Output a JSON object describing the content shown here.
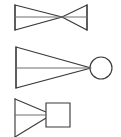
{
  "canvas": {
    "width": 121,
    "height": 137,
    "background": "#ffffff",
    "stroke_color": "#3b3b3b",
    "axis_color": "#6e6e6e",
    "stroke_width": 1.15
  },
  "figures": [
    {
      "id": "figure-1",
      "name": "bowtie-nozzle",
      "description": "Bowtie / hourglass outline formed by two triangles meeting at a central point, with a horizontal centerline axis",
      "left_triangle": "15,5 62,17 15,30",
      "right_triangle": "87,5 62,17 87,30",
      "left_edge": "15,5 15,30",
      "right_edge": "87,5 87,30",
      "axis": "15,17 87,17",
      "crossing_point": "62,17"
    },
    {
      "id": "figure-2",
      "name": "triangle-with-circle",
      "description": "Right-pointing elongated triangle whose apex meets a circle, with a horizontal centerline axis",
      "triangle": "16,47 91,68 16,88",
      "left_edge": "16,47 16,88",
      "axis": "16,68 91,68",
      "circle": {
        "cx": 101,
        "cy": 68,
        "r": 11
      }
    },
    {
      "id": "figure-3",
      "name": "triangle-with-square",
      "description": "Right-pointing triangle truncated by an attached square block, with a horizontal centerline axis, bottom edge cropped by the frame",
      "upper_edge": "15,99 46,112",
      "lower_edge": "15,137 46,118",
      "left_edge": "15,99 15,137",
      "axis": "15,115 46,115",
      "square": {
        "x": 46,
        "y": 103,
        "width": 24,
        "height": 24
      }
    }
  ]
}
